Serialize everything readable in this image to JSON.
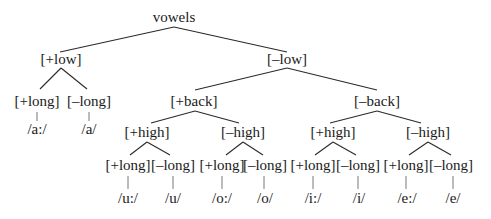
{
  "diagram": {
    "type": "feature-tree",
    "root": "vowels",
    "nodes": {
      "root": {
        "label": "vowels",
        "x": 174,
        "y": 22
      },
      "plus_low": {
        "label": "[+low]",
        "x": 61,
        "y": 64
      },
      "minus_low": {
        "label": "[–low]",
        "x": 287,
        "y": 64
      },
      "low_plus_long": {
        "label": "[+long]",
        "x": 37,
        "y": 106
      },
      "low_minus_long": {
        "label": "[–long]",
        "x": 89,
        "y": 106
      },
      "plus_back": {
        "label": "[+back]",
        "x": 194,
        "y": 106
      },
      "minus_back": {
        "label": "[–back]",
        "x": 377,
        "y": 106
      },
      "back_plus_high": {
        "label": "[+high]",
        "x": 147,
        "y": 137
      },
      "back_minus_high": {
        "label": "[–high]",
        "x": 243,
        "y": 137
      },
      "front_plus_high": {
        "label": "[+high]",
        "x": 333,
        "y": 137
      },
      "front_minus_high": {
        "label": "[–high]",
        "x": 428,
        "y": 137
      },
      "bph_plus_long": {
        "label": "[+long]",
        "x": 128,
        "y": 170
      },
      "bph_minus_long": {
        "label": "[–long]",
        "x": 173,
        "y": 170
      },
      "bmh_plus_long": {
        "label": "[+long]",
        "x": 222,
        "y": 170
      },
      "bmh_minus_long": {
        "label": "[–long]",
        "x": 265,
        "y": 170
      },
      "fph_plus_long": {
        "label": "[+long]",
        "x": 313,
        "y": 170
      },
      "fph_minus_long": {
        "label": "[–long]",
        "x": 358,
        "y": 170
      },
      "fmh_plus_long": {
        "label": "[+long]",
        "x": 406,
        "y": 170
      },
      "fmh_minus_long": {
        "label": "[–long]",
        "x": 451,
        "y": 170
      }
    },
    "leaves": [
      {
        "label": "/a:/",
        "x": 37,
        "y": 134
      },
      {
        "label": "/a/",
        "x": 89,
        "y": 134
      },
      {
        "label": "/u:/",
        "x": 128,
        "y": 203
      },
      {
        "label": "/u/",
        "x": 173,
        "y": 203
      },
      {
        "label": "/o:/",
        "x": 222,
        "y": 203
      },
      {
        "label": "/o/",
        "x": 265,
        "y": 203
      },
      {
        "label": "/i:/",
        "x": 313,
        "y": 203
      },
      {
        "label": "/i/",
        "x": 359,
        "y": 203
      },
      {
        "label": "/e:/",
        "x": 407,
        "y": 203
      },
      {
        "label": "/e/",
        "x": 453,
        "y": 203
      }
    ],
    "edges": [
      [
        174,
        27,
        60,
        52
      ],
      [
        174,
        27,
        287,
        52
      ],
      [
        61,
        68,
        40,
        89
      ],
      [
        61,
        68,
        87,
        89
      ],
      [
        287,
        68,
        195,
        90
      ],
      [
        287,
        68,
        377,
        90
      ],
      [
        195,
        111,
        151,
        123
      ],
      [
        195,
        111,
        239,
        123
      ],
      [
        377,
        111,
        330,
        123
      ],
      [
        377,
        111,
        421,
        123
      ],
      [
        147,
        142,
        130,
        155
      ],
      [
        147,
        142,
        170,
        155
      ],
      [
        243,
        142,
        226,
        155
      ],
      [
        243,
        142,
        263,
        155
      ],
      [
        333,
        142,
        315,
        155
      ],
      [
        333,
        142,
        356,
        155
      ],
      [
        428,
        142,
        409,
        155
      ],
      [
        428,
        142,
        451,
        155
      ]
    ],
    "stems": [
      [
        37,
        112,
        37,
        121
      ],
      [
        89,
        112,
        89,
        121
      ],
      [
        128,
        176,
        128,
        189
      ],
      [
        173,
        176,
        173,
        189
      ],
      [
        222,
        176,
        222,
        189
      ],
      [
        264,
        176,
        264,
        189
      ],
      [
        313,
        176,
        313,
        189
      ],
      [
        358,
        176,
        358,
        189
      ],
      [
        406,
        176,
        406,
        189
      ],
      [
        453,
        176,
        453,
        189
      ]
    ]
  }
}
